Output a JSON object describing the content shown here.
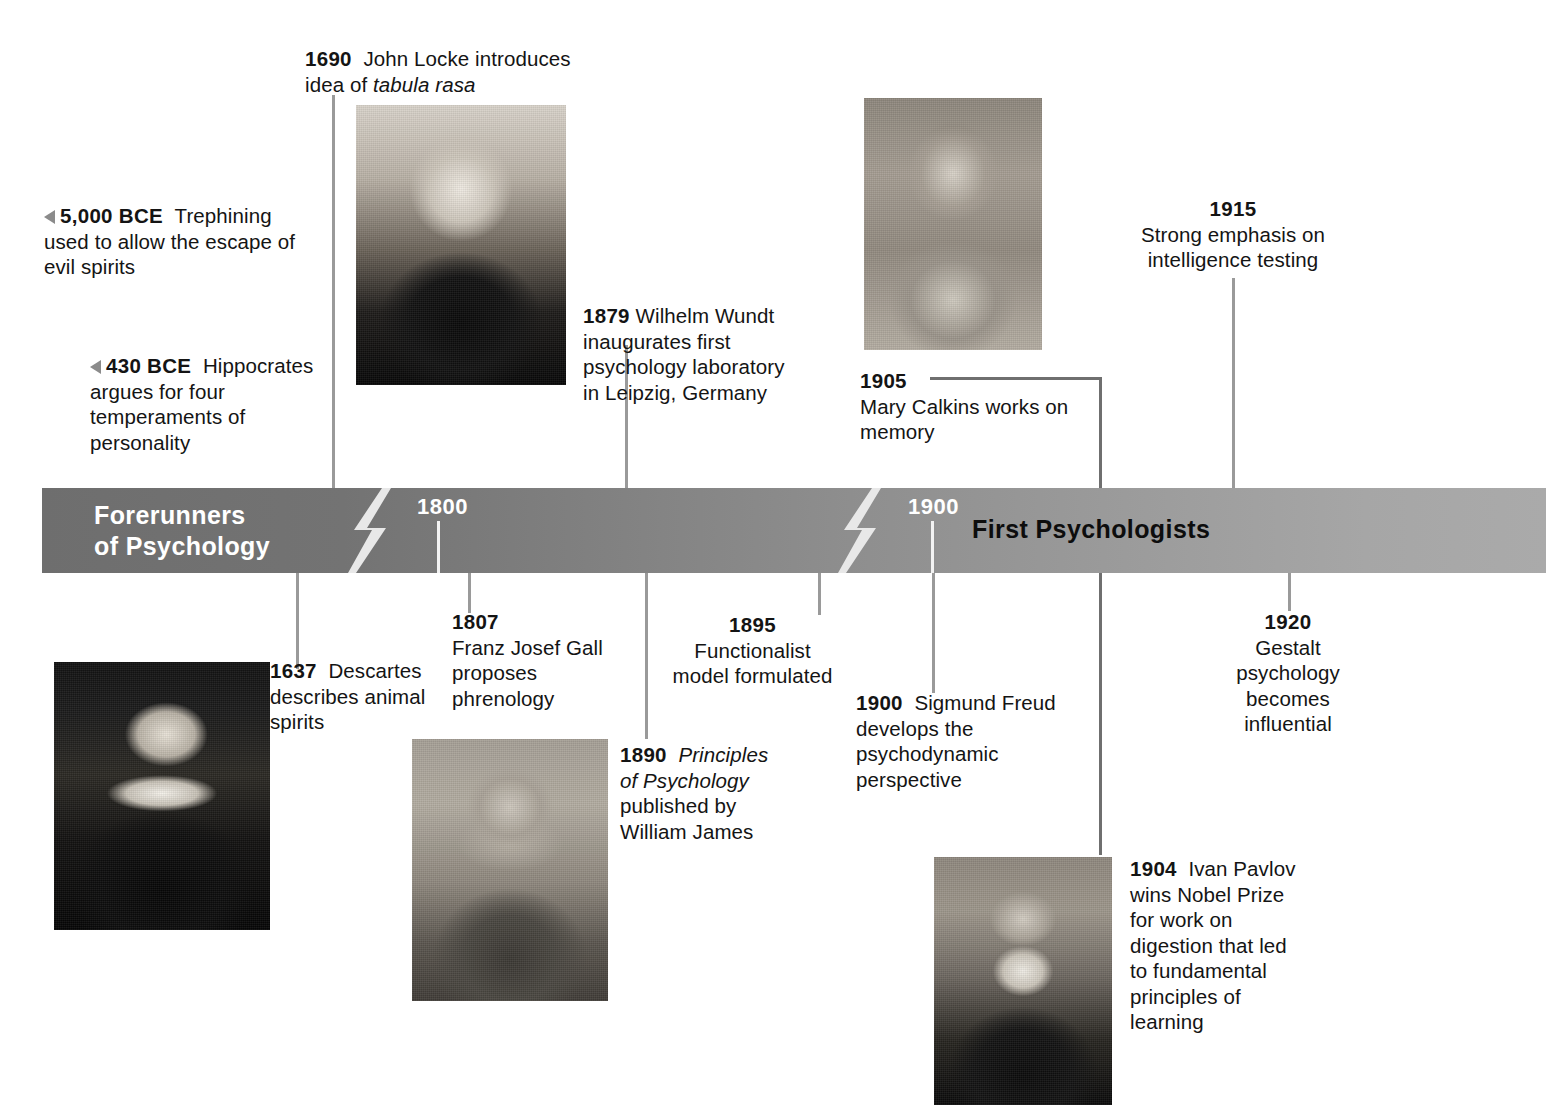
{
  "timeline_bar": {
    "era_left": "Forerunners\nof Psychology",
    "era_left_line1": "Forerunners",
    "era_left_line2": "of Psychology",
    "era_right": "First Psychologists",
    "tick_labels": [
      "1800",
      "1900"
    ],
    "tick_1800": "1800",
    "tick_1900": "1900",
    "break_marks": 2,
    "colors": {
      "bar_left": "#6e6e6e",
      "bar_right": "#aaaaaa",
      "era_left_text": "#ffffff",
      "era_right_text": "#0d0d0d",
      "connector_line": "#9a9a9a",
      "arrow_marker": "#8b8b8b"
    }
  },
  "events_above": [
    {
      "id": "5000-bce",
      "year": "5,000 BCE",
      "text": "Trephining used to allow the escape of evil spirits",
      "line1_rest": "Trephining",
      "line2": "used to allow the escape of",
      "line3": "evil spirits",
      "marker": "triangle-left"
    },
    {
      "id": "430-bce",
      "year": "430 BCE",
      "text": "Hippocrates argues for four temperaments of personality",
      "line1_rest": "Hippocrates",
      "line2": "argues for four",
      "line3": "temperaments of",
      "line4": "personality",
      "marker": "triangle-left"
    },
    {
      "id": "1690",
      "year": "1690",
      "line1_rest": "John Locke introduces",
      "line2_pre": "idea of ",
      "line2_italic": "tabula rasa",
      "text": "John Locke introduces idea of tabula rasa"
    },
    {
      "id": "1879",
      "year": "1879",
      "line1_rest": "Wilhelm Wundt",
      "line2": "inaugurates first",
      "line3": "psychology laboratory",
      "line4": "in Leipzig, Germany",
      "text": "Wilhelm Wundt inaugurates first psychology laboratory in Leipzig, Germany"
    },
    {
      "id": "1905",
      "year": "1905",
      "line2": "Mary Calkins works on",
      "line3": "memory",
      "text": "Mary Calkins works on memory"
    },
    {
      "id": "1915",
      "year": "1915",
      "line2": "Strong emphasis on",
      "line3": "intelligence testing",
      "text": "Strong emphasis on intelligence testing"
    }
  ],
  "events_below": [
    {
      "id": "1637",
      "year": "1637",
      "line1_rest": "Descartes",
      "line2": "describes animal",
      "line3": "spirits",
      "text": "Descartes describes animal spirits"
    },
    {
      "id": "1807",
      "year": "1807",
      "line2": "Franz Josef Gall",
      "line3": "proposes",
      "line4": "phrenology",
      "text": "Franz Josef Gall proposes phrenology"
    },
    {
      "id": "1890",
      "year": "1890",
      "line1_italic": "Principles",
      "line2_italic": "of Psychology",
      "line3": "published by",
      "line4": "William James",
      "text": "Principles of Psychology published by William James"
    },
    {
      "id": "1895",
      "year": "1895",
      "line2": "Functionalist",
      "line3": "model formulated",
      "text": "Functionalist model formulated"
    },
    {
      "id": "1900",
      "year": "1900",
      "line1_rest": "Sigmund Freud",
      "line2": "develops the",
      "line3": "psychodynamic",
      "line4": "perspective",
      "text": "Sigmund Freud develops the psychodynamic perspective"
    },
    {
      "id": "1904",
      "year": "1904",
      "line1_rest": "Ivan Pavlov",
      "line2": "wins Nobel Prize",
      "line3": "for work on",
      "line4": "digestion that led",
      "line5": "to fundamental",
      "line6": "principles of",
      "line7": "learning",
      "text": "Ivan Pavlov wins Nobel Prize for work on digestion that led to fundamental principles of learning"
    },
    {
      "id": "1920",
      "year": "1920",
      "line2": "Gestalt",
      "line3": "psychology",
      "line4": "becomes",
      "line5": "influential",
      "text": "Gestalt psychology becomes influential"
    }
  ],
  "portraits": [
    {
      "id": "locke",
      "subject": "John Locke",
      "caption": ""
    },
    {
      "id": "calkins",
      "subject": "Mary Calkins",
      "caption": ""
    },
    {
      "id": "descartes",
      "subject": "Rene Descartes",
      "caption": ""
    },
    {
      "id": "james",
      "subject": "William James",
      "caption": ""
    },
    {
      "id": "pavlov",
      "subject": "Ivan Pavlov",
      "caption": ""
    }
  ]
}
